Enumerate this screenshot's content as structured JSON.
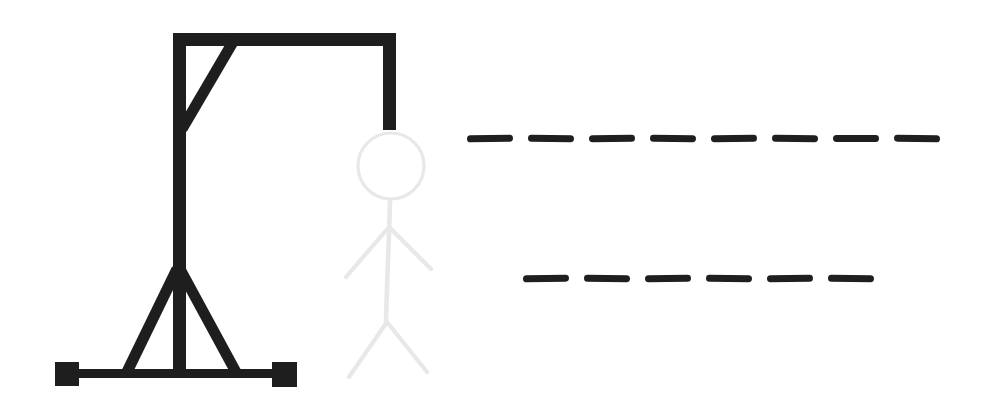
{
  "scene": {
    "type": "hangman-drawing",
    "background_color": "#ffffff",
    "gallows": {
      "color": "#1e1e1e",
      "parts": [
        "base-bar",
        "left-foot",
        "right-foot",
        "post",
        "beam",
        "diagonal-brace",
        "triangle-left-leg",
        "triangle-right-leg",
        "rope"
      ]
    },
    "figure": {
      "color": "#e8e8e8",
      "style": "faded",
      "parts": [
        "head",
        "body",
        "left-arm",
        "right-arm",
        "left-leg",
        "right-leg"
      ]
    },
    "word_blanks": {
      "dash_color": "#1f1f1f",
      "rows": [
        {
          "dash_count": 8
        },
        {
          "dash_count": 6
        }
      ]
    }
  }
}
